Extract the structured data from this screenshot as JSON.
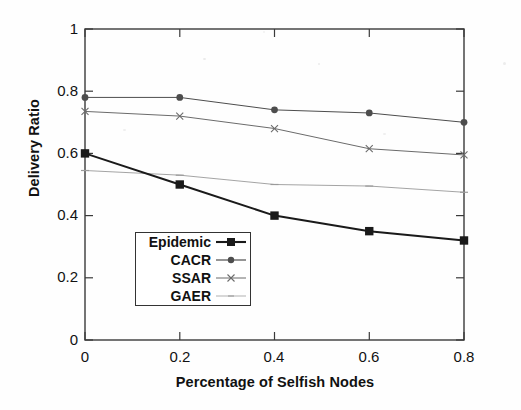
{
  "chart_data": {
    "type": "line",
    "title": "",
    "xlabel": "Percentage of Selfish Nodes",
    "ylabel": "Delivery Ratio",
    "x": [
      0,
      0.2,
      0.4,
      0.6,
      0.8
    ],
    "xlim": [
      0,
      0.8
    ],
    "ylim": [
      0,
      1
    ],
    "xticks": [
      "0",
      "0.2",
      "0.4",
      "0.6",
      "0.8"
    ],
    "yticks": [
      "0",
      "0.2",
      "0.4",
      "0.6",
      "0.8",
      "1"
    ],
    "grid": false,
    "legend_position": "lower-left-inside",
    "series": [
      {
        "name": "Epidemic",
        "marker": "filled-square",
        "color": "#1a1a1a",
        "linewidth": 2.0,
        "values": [
          0.6,
          0.5,
          0.4,
          0.35,
          0.32
        ]
      },
      {
        "name": "CACR",
        "marker": "filled-circle",
        "color": "#4d4d4d",
        "linewidth": 1.0,
        "values": [
          0.78,
          0.78,
          0.74,
          0.73,
          0.7
        ]
      },
      {
        "name": "SSAR",
        "marker": "x-cross",
        "color": "#6b6b6b",
        "linewidth": 1.0,
        "values": [
          0.735,
          0.72,
          0.68,
          0.615,
          0.595
        ]
      },
      {
        "name": "GAER",
        "marker": "faint-tick",
        "color": "#9a9a9a",
        "linewidth": 0.9,
        "values": [
          0.545,
          0.53,
          0.5,
          0.495,
          0.475
        ]
      }
    ]
  },
  "axes": {
    "x_title": "Percentage of Selfish Nodes",
    "y_title": "Delivery Ratio",
    "x_tick_labels": [
      "0",
      "0.2",
      "0.4",
      "0.6",
      "0.8"
    ],
    "y_tick_labels": [
      "1",
      "0.8",
      "0.6",
      "0.4",
      "0.2",
      "0"
    ]
  },
  "legend": {
    "entries": [
      {
        "label": "Epidemic",
        "marker": "filled-square"
      },
      {
        "label": "CACR",
        "marker": "filled-circle"
      },
      {
        "label": "SSAR",
        "marker": "x-cross"
      },
      {
        "label": "GAER",
        "marker": "faint-tick"
      }
    ]
  },
  "colors": {
    "axis": "#3a3a3a",
    "epidemic": "#1a1a1a",
    "cacr": "#4d4d4d",
    "ssar": "#6b6b6b",
    "gaer": "#9a9a9a",
    "background": "#fefefe"
  }
}
